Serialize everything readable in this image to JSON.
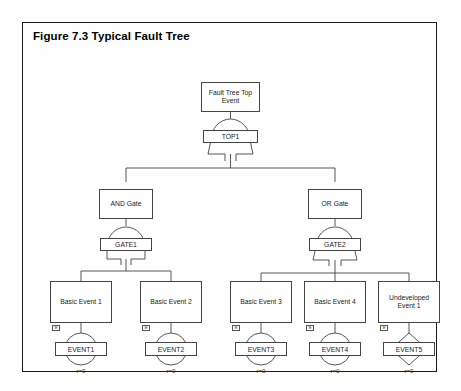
{
  "figure": {
    "title": "Figure 7.3  Typical Fault Tree"
  },
  "diagram": {
    "type": "fault-tree",
    "top_event": {
      "id": "top-event",
      "label": "Fault Tree Top Event"
    },
    "gates": [
      {
        "id": "TOP1",
        "label": "TOP1",
        "gate_type": "or",
        "parent_box": "top-event",
        "children": [
          "and-gate-box",
          "or-gate-box"
        ]
      },
      {
        "id": "GATE1",
        "label": "GATE1",
        "gate_type": "and",
        "parent_box": "and-gate-box",
        "children": [
          "basic-event-1",
          "basic-event-2"
        ]
      },
      {
        "id": "GATE2",
        "label": "GATE2",
        "gate_type": "or",
        "parent_box": "or-gate-box",
        "children": [
          "basic-event-3",
          "basic-event-4",
          "undeveloped-event-1"
        ]
      }
    ],
    "intermediate_boxes": [
      {
        "id": "and-gate-box",
        "label": "AND Gate"
      },
      {
        "id": "or-gate-box",
        "label": "OR Gate"
      }
    ],
    "event_boxes": [
      {
        "id": "basic-event-1",
        "label": "Basic Event 1"
      },
      {
        "id": "basic-event-2",
        "label": "Basic Event 2"
      },
      {
        "id": "basic-event-3",
        "label": "Basic Event 3"
      },
      {
        "id": "basic-event-4",
        "label": "Basic Event 4"
      },
      {
        "id": "undeveloped-event-1",
        "label": "Undeveloped Event 1"
      }
    ],
    "leaf_symbols": [
      {
        "id": "EVENT1",
        "label": "EVENT1",
        "shape": "circle",
        "tag": "IE",
        "rate": "r=0"
      },
      {
        "id": "EVENT2",
        "label": "EVENT2",
        "shape": "circle",
        "tag": "IE",
        "rate": "r=0"
      },
      {
        "id": "EVENT3",
        "label": "EVENT3",
        "shape": "circle",
        "tag": "IE",
        "rate": "r=0"
      },
      {
        "id": "EVENT4",
        "label": "EVENT4",
        "shape": "circle",
        "tag": "IE",
        "rate": "r=0"
      },
      {
        "id": "EVENT5",
        "label": "EVENT5",
        "shape": "diamond",
        "tag": "IE",
        "rate": "r=0"
      }
    ]
  },
  "colors": {
    "line": "#444444",
    "border": "#1a1a1a",
    "text": "#1a1a1a",
    "background": "#fefefe"
  }
}
